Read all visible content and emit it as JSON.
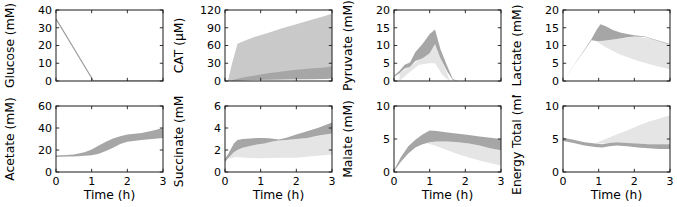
{
  "figure_background": "#ffffff",
  "colors": {
    "frame": "#1a1a1a",
    "text": "#000000",
    "dark": "#a6a6a6",
    "light": "#c9c9c9",
    "faint": "#e5e5e5",
    "line": "#999999"
  },
  "chart_data": [
    {
      "name": "glucose",
      "type": "line",
      "ylabel": "Glucose (mM)",
      "ylim": [
        0,
        40
      ],
      "yticks": [
        0,
        10,
        20,
        30,
        40
      ],
      "xlim": [
        0,
        3
      ],
      "xticks": [
        0,
        1,
        2,
        3
      ],
      "xlabel": "",
      "show_x_tick_labels": false,
      "bands": [],
      "lines": [
        {
          "shade": "line",
          "x": [
            0,
            1.05,
            3
          ],
          "y": [
            35,
            0,
            0
          ]
        }
      ]
    },
    {
      "name": "cat",
      "type": "area",
      "ylabel": "CAT (μM)",
      "ylim": [
        0,
        120
      ],
      "yticks": [
        0,
        30,
        60,
        90,
        120
      ],
      "xlim": [
        0,
        3
      ],
      "xticks": [
        0,
        1,
        2,
        3
      ],
      "xlabel": "",
      "show_x_tick_labels": false,
      "bands": [
        {
          "shade": "light",
          "x": [
            0.08,
            0.2,
            0.35,
            0.5,
            0.8,
            1.2,
            1.6,
            2.0,
            2.4,
            2.8,
            3.0
          ],
          "upper": [
            0,
            30,
            63,
            67,
            74,
            81,
            89,
            96,
            103,
            110,
            114
          ],
          "lower": [
            0,
            0.5,
            1,
            1.5,
            2,
            2.5,
            3,
            3,
            3.5,
            4,
            4
          ]
        },
        {
          "shade": "dark",
          "x": [
            0.1,
            0.3,
            0.5,
            0.8,
            1.2,
            1.6,
            2.0,
            2.4,
            2.8,
            3.0
          ],
          "upper": [
            0,
            3,
            6,
            9,
            13,
            16,
            19,
            21,
            23,
            25
          ],
          "lower": [
            0,
            0.5,
            1,
            1.5,
            2,
            2.5,
            3,
            3,
            3.5,
            4
          ]
        }
      ],
      "lines": []
    },
    {
      "name": "pyruvate",
      "type": "area",
      "ylabel": "Pyruvate (mM)",
      "ylim": [
        0,
        20
      ],
      "yticks": [
        0,
        5,
        10,
        15,
        20
      ],
      "xlim": [
        0,
        3
      ],
      "xticks": [
        0,
        1,
        2,
        3
      ],
      "xlabel": "",
      "show_x_tick_labels": false,
      "bands": [
        {
          "shade": "faint",
          "x": [
            0.15,
            0.4,
            0.7,
            1.0,
            1.15,
            1.35,
            1.55
          ],
          "upper": [
            2.2,
            3.8,
            6.0,
            7.8,
            10.4,
            5.5,
            0.5
          ],
          "lower": [
            0,
            2.2,
            4.6,
            5.0,
            5.0,
            1.8,
            0
          ]
        },
        {
          "shade": "dark",
          "x": [
            0,
            0.15,
            0.3,
            0.45,
            0.6,
            0.8,
            1.0,
            1.15,
            1.3,
            1.5,
            1.65,
            1.8
          ],
          "upper": [
            1.5,
            2.8,
            4.6,
            5.2,
            8.2,
            10.4,
            13.2,
            14.5,
            9.0,
            4.0,
            0.6,
            0
          ],
          "lower": [
            1.1,
            2.2,
            3.5,
            4.0,
            5.6,
            6.4,
            7.8,
            10.4,
            6.5,
            2.5,
            0.3,
            0
          ]
        }
      ],
      "lines": []
    },
    {
      "name": "lactate",
      "type": "area",
      "ylabel": "Lactate (mM)",
      "ylim": [
        0,
        20
      ],
      "yticks": [
        0,
        5,
        10,
        15,
        20
      ],
      "xlim": [
        0,
        3
      ],
      "xticks": [
        0,
        1,
        2,
        3
      ],
      "xlabel": "",
      "show_x_tick_labels": false,
      "bands": [
        {
          "shade": "faint",
          "x": [
            0.9,
            1.2,
            1.6,
            2.0,
            2.5,
            3.0
          ],
          "upper": [
            11.4,
            11.4,
            12.0,
            12.5,
            11.8,
            10.2
          ],
          "lower": [
            11.4,
            9.5,
            7.5,
            6.0,
            4.5,
            3.3
          ]
        },
        {
          "shade": "dark",
          "x": [
            0,
            0.3,
            0.6,
            0.8,
            0.95,
            1.05,
            1.2,
            1.4,
            1.6,
            1.8,
            2.0,
            2.3,
            2.6,
            3.0
          ],
          "upper": [
            0,
            4.4,
            8.8,
            11.8,
            14.6,
            16.0,
            15.4,
            14.4,
            13.7,
            13.2,
            12.9,
            12.5,
            11.6,
            10.4
          ],
          "lower": [
            0,
            4.3,
            8.6,
            11.5,
            11.3,
            11.3,
            11.4,
            11.7,
            12.0,
            12.3,
            12.5,
            12.4,
            11.5,
            10.2
          ]
        }
      ],
      "lines": []
    },
    {
      "name": "acetate",
      "type": "area",
      "ylabel": "Acetate (mM)",
      "ylim": [
        0,
        60
      ],
      "yticks": [
        0,
        20,
        40,
        60
      ],
      "xlim": [
        0,
        3
      ],
      "xticks": [
        0,
        1,
        2,
        3
      ],
      "xlabel": "Time (h)",
      "show_x_tick_labels": true,
      "bands": [
        {
          "shade": "dark",
          "x": [
            0,
            0.3,
            0.5,
            0.8,
            1.0,
            1.2,
            1.4,
            1.6,
            1.8,
            2.0,
            2.4,
            2.7,
            3.0
          ],
          "upper": [
            15.0,
            15.5,
            16.0,
            18.0,
            20.5,
            24.0,
            27.5,
            30.5,
            32.5,
            34.0,
            35.5,
            37.5,
            40.0
          ],
          "lower": [
            13.5,
            14.0,
            14.2,
            14.8,
            15.2,
            16.5,
            19.0,
            22.0,
            25.5,
            27.5,
            29.0,
            30.0,
            31.0
          ]
        }
      ],
      "lines": []
    },
    {
      "name": "succinate",
      "type": "area",
      "ylabel": "Succinate (mM)",
      "ylim": [
        0,
        6
      ],
      "yticks": [
        0,
        2,
        4,
        6
      ],
      "xlim": [
        0,
        3
      ],
      "xticks": [
        0,
        1,
        2,
        3
      ],
      "xlabel": "Time (h)",
      "show_x_tick_labels": true,
      "bands": [
        {
          "shade": "faint",
          "x": [
            0.1,
            0.3,
            0.6,
            1.0,
            1.5,
            2.0,
            2.5,
            3.0
          ],
          "upper": [
            1.3,
            1.9,
            2.3,
            2.55,
            2.85,
            3.0,
            3.2,
            3.5
          ],
          "lower": [
            1.2,
            1.35,
            1.3,
            1.25,
            1.3,
            1.3,
            1.45,
            1.6
          ]
        },
        {
          "shade": "dark",
          "x": [
            0,
            0.1,
            0.25,
            0.35,
            0.5,
            0.7,
            0.9,
            1.1,
            1.3,
            1.5,
            1.7,
            2.0,
            2.3,
            2.6,
            3.0
          ],
          "upper": [
            1.2,
            1.7,
            2.6,
            2.9,
            3.0,
            3.05,
            3.1,
            3.1,
            3.05,
            2.95,
            3.1,
            3.4,
            3.7,
            4.0,
            4.5
          ],
          "lower": [
            0.9,
            1.3,
            1.8,
            2.0,
            2.2,
            2.35,
            2.5,
            2.6,
            2.75,
            2.85,
            2.9,
            3.0,
            3.1,
            3.3,
            3.5
          ]
        }
      ],
      "lines": []
    },
    {
      "name": "malate",
      "type": "area",
      "ylabel": "Malate (mM)",
      "ylim": [
        0,
        10
      ],
      "yticks": [
        0,
        5,
        10
      ],
      "xlim": [
        0,
        3
      ],
      "xticks": [
        0,
        1,
        2,
        3
      ],
      "xlabel": "Time (h)",
      "show_x_tick_labels": true,
      "bands": [
        {
          "shade": "faint",
          "x": [
            0.9,
            1.2,
            1.5,
            1.8,
            2.1,
            2.5,
            3.0
          ],
          "upper": [
            4.4,
            4.6,
            4.6,
            4.5,
            4.3,
            3.9,
            3.3
          ],
          "lower": [
            4.4,
            3.9,
            3.3,
            2.7,
            2.2,
            1.6,
            1.0
          ]
        },
        {
          "shade": "dark",
          "x": [
            0,
            0.2,
            0.4,
            0.6,
            0.8,
            1.0,
            1.2,
            1.5,
            1.8,
            2.1,
            2.4,
            2.7,
            3.0
          ],
          "upper": [
            0.3,
            2.3,
            3.9,
            4.9,
            5.7,
            6.3,
            6.2,
            6.0,
            5.8,
            5.6,
            5.4,
            5.2,
            5.0
          ],
          "lower": [
            0.1,
            1.6,
            2.8,
            3.7,
            4.2,
            4.5,
            4.6,
            4.6,
            4.5,
            4.3,
            4.0,
            3.6,
            3.3
          ]
        }
      ],
      "lines": []
    },
    {
      "name": "energy-total",
      "type": "area",
      "ylabel": "Energy Total (mM)",
      "ylim": [
        0,
        10
      ],
      "yticks": [
        0,
        5,
        10
      ],
      "xlim": [
        0,
        3
      ],
      "xticks": [
        0,
        1,
        2,
        3
      ],
      "xlabel": "Time (h)",
      "show_x_tick_labels": true,
      "bands": [
        {
          "shade": "faint",
          "x": [
            0.9,
            1.2,
            1.5,
            1.8,
            2.1,
            2.4,
            2.7,
            3.0
          ],
          "upper": [
            4.3,
            5.0,
            5.7,
            6.3,
            7.0,
            7.6,
            8.1,
            8.6
          ],
          "lower": [
            4.3,
            4.3,
            4.5,
            4.4,
            4.3,
            4.2,
            4.2,
            4.2
          ]
        },
        {
          "shade": "dark",
          "x": [
            0,
            0.3,
            0.6,
            0.9,
            1.1,
            1.3,
            1.5,
            1.8,
            2.1,
            2.4,
            2.7,
            3.0
          ],
          "upper": [
            5.2,
            4.9,
            4.5,
            4.3,
            4.2,
            4.4,
            4.5,
            4.4,
            4.3,
            4.2,
            4.2,
            4.2
          ],
          "lower": [
            4.7,
            4.4,
            4.0,
            3.8,
            3.7,
            3.9,
            4.0,
            3.9,
            3.7,
            3.6,
            3.5,
            3.5
          ]
        }
      ],
      "lines": []
    }
  ]
}
